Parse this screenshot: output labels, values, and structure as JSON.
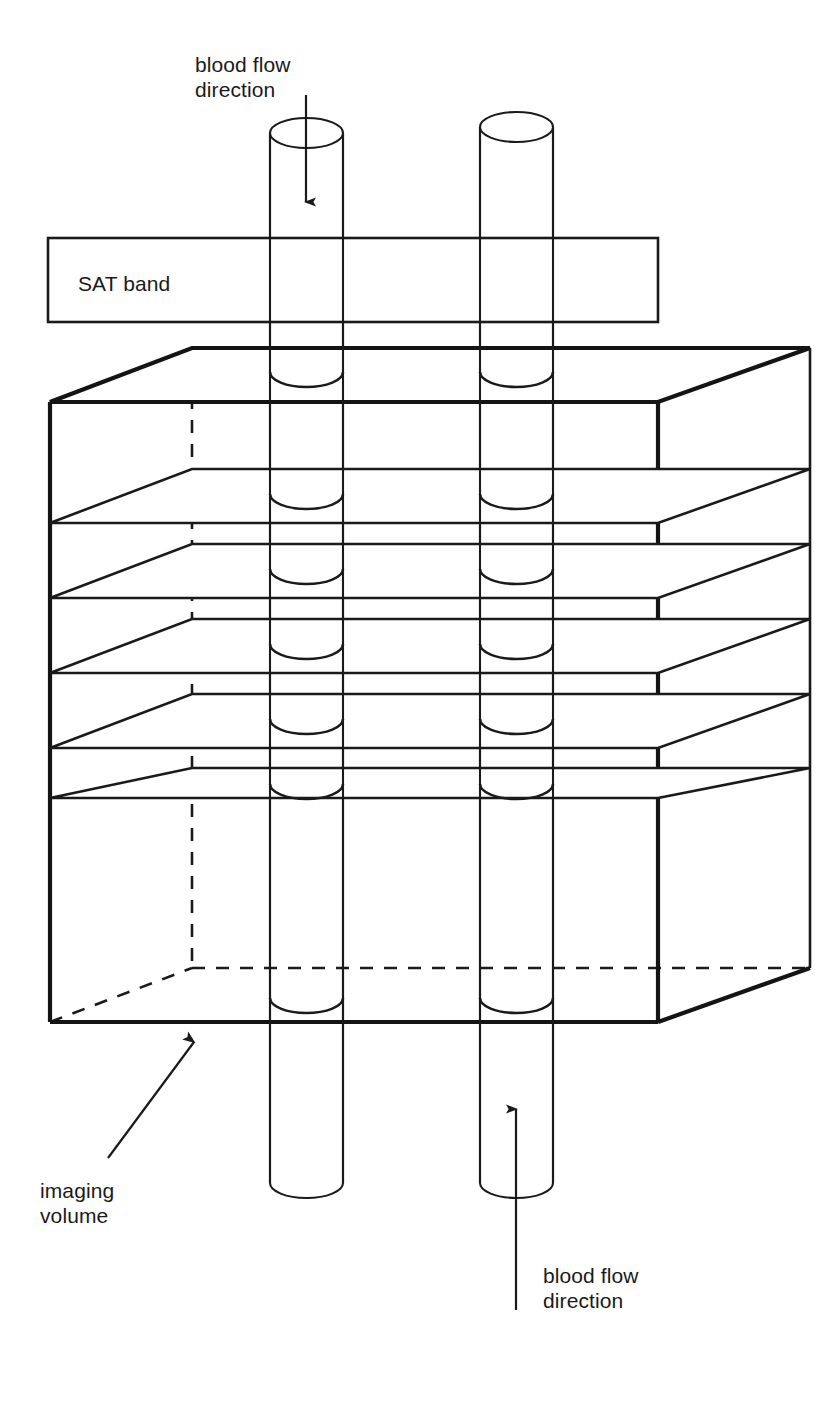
{
  "figure": {
    "background_color": "#ffffff",
    "line_color": "#1a1a1a",
    "width": 833,
    "height": 1410
  },
  "labels": {
    "top_flow_line1": "blood flow",
    "top_flow_line2": "direction",
    "sat_band": "SAT band",
    "imaging_volume_line1": "imaging",
    "imaging_volume_line2": "volume",
    "bottom_flow_line1": "blood flow",
    "bottom_flow_line2": "direction"
  },
  "diagram_data": {
    "type": "schematic-3d",
    "sat_band": {
      "x": 48,
      "y": 238,
      "width": 610,
      "height": 84,
      "label_x": 78,
      "label_y": 290
    },
    "imaging_volume_box": {
      "front_left_x": 50,
      "front_right_x": 658,
      "back_left_x": 192,
      "back_right_x": 810,
      "front_top_y": 402,
      "front_bottom_y": 1022,
      "back_top_y": 348,
      "back_bottom_y": 968,
      "depth_dx": 142,
      "depth_dy": -54
    },
    "slices": {
      "count": 5,
      "front_y": [
        523,
        598,
        673,
        748,
        798
      ],
      "description": "five imaging slice planes drawn as parallelograms inside the volume"
    },
    "cylinders": [
      {
        "name": "left-vessel",
        "left_x": 270,
        "right_x": 343,
        "top_y": 133,
        "bottom_y": 1198,
        "ellipse_ry": 15,
        "flow": "down"
      },
      {
        "name": "right-vessel",
        "left_x": 480,
        "right_x": 553,
        "top_y": 127,
        "bottom_y": 1198,
        "ellipse_ry": 15,
        "flow": "up"
      }
    ],
    "arrows": [
      {
        "name": "top-flow-arrow",
        "from_x": 306,
        "from_y": 95,
        "to_x": 306,
        "to_y": 216,
        "direction": "down"
      },
      {
        "name": "bottom-flow-arrow",
        "from_x": 516,
        "from_y": 1310,
        "to_x": 516,
        "to_y": 1095,
        "direction": "up"
      },
      {
        "name": "imaging-volume-leader",
        "from_x": 108,
        "from_y": 1158,
        "to_x": 200,
        "to_y": 1033,
        "direction": "up-right"
      }
    ],
    "text_positions": {
      "top_flow": {
        "x": 195,
        "y": 72
      },
      "imaging_volume": {
        "x": 40,
        "y": 1200
      },
      "bottom_flow": {
        "x": 543,
        "y": 1278
      }
    }
  }
}
